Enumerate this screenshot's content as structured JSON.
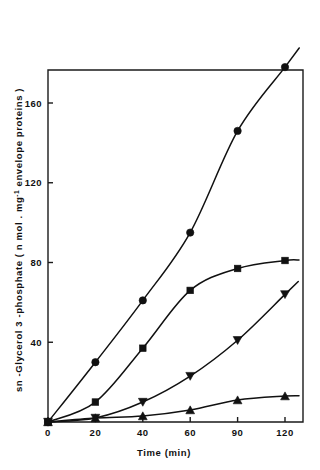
{
  "figure": {
    "background_color": "#ffffff",
    "ink_color": "#111111"
  },
  "chart_data": {
    "type": "line",
    "title": "",
    "xlabel": "Time (min)",
    "ylabel_parts": {
      "main_before": "sn -Glycerol 3 -phosphate  ( n mol . mg",
      "superscript": "-1",
      "main_after": " envelope  proteins )"
    },
    "ylabel": "sn-Glycerol 3-phosphate (nmol.mg-1 envelope proteins)",
    "x": [
      0,
      20,
      40,
      60,
      90,
      120
    ],
    "xtick_labels": [
      "0",
      "20",
      "40",
      "60",
      "90",
      "120"
    ],
    "x_axis_spacing": "categorical",
    "ytick_values": [
      40,
      80,
      120,
      160
    ],
    "ytick_labels": [
      "40",
      "80",
      "120",
      "160"
    ],
    "ylim": [
      0,
      190
    ],
    "grid": false,
    "legend": "none",
    "series": [
      {
        "name": "series-circle",
        "marker": "circle",
        "values": [
          0,
          30,
          61,
          95,
          146,
          178
        ]
      },
      {
        "name": "series-square",
        "marker": "square",
        "values": [
          0,
          10,
          37,
          66,
          77,
          81
        ]
      },
      {
        "name": "series-triangle-down",
        "marker": "triangle-down",
        "values": [
          0,
          2,
          10,
          23,
          41,
          64
        ]
      },
      {
        "name": "series-triangle-up",
        "marker": "triangle-up",
        "values": [
          0,
          2,
          3,
          6,
          11,
          13
        ]
      }
    ]
  }
}
